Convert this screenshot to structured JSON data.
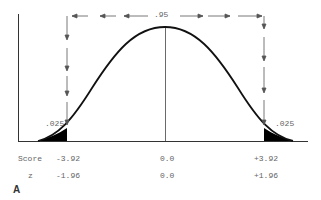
{
  "diagram": {
    "type": "normal-distribution",
    "center_probability": ".95",
    "left_tail_probability": ".025",
    "right_tail_probability": ".025",
    "rows": [
      {
        "label": "Score",
        "left": "-3.92",
        "center": "0.0",
        "right": "+3.92"
      },
      {
        "label": "z",
        "left": "-1.96",
        "center": "0.0",
        "right": "+1.96"
      }
    ],
    "figure_label": "A"
  }
}
